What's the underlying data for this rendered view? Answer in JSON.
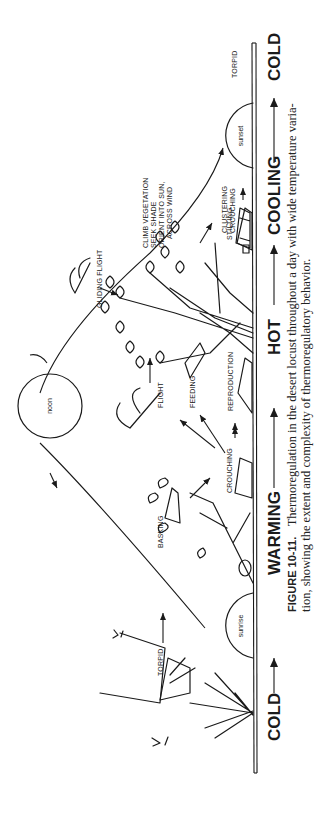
{
  "figure": {
    "orientation": "rotated-90-ccw",
    "caption": {
      "label": "FIGURE 10-11.",
      "line1": "Thermoregulation in the desert locust throughout a day with wide temperature varia-",
      "line2": "tion, showing the extent and complexity of thermoregulatory behavior."
    },
    "phases": [
      {
        "label": "COLD"
      },
      {
        "label": "WARMING"
      },
      {
        "label": "HOT"
      },
      {
        "label": "COOLING"
      },
      {
        "label": "COLD"
      }
    ],
    "sun_positions": [
      {
        "label": "sunrise"
      },
      {
        "label": "noon"
      },
      {
        "label": "sunset"
      }
    ],
    "behaviors": {
      "torpid_morning": "TORPID",
      "basking": "BASKING",
      "crouching": "CROUCHING",
      "flight": "FLIGHT",
      "feeding": "FEEDING",
      "reproduction": "REPRODUCTION",
      "gliding_flight": "GLIDING FLIGHT",
      "climb_1": "CLIMB VEGETATION",
      "climb_2": "SEEK SHADE",
      "climb_3": "ORIENT INTO SUN,",
      "climb_4": "ACROSS WIND",
      "stilting": "STILTING",
      "clustering": "CLUSTERING",
      "crouching_evening": "CROUCHING",
      "torpid_evening": "TORPID"
    }
  }
}
